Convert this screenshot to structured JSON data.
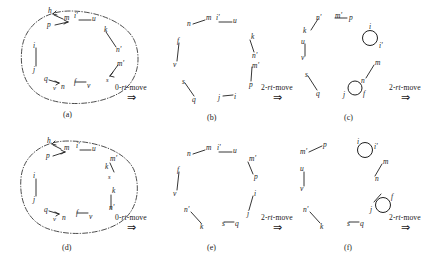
{
  "figure": {
    "width": 441,
    "height": 272,
    "ink_color": "#1a1a1a",
    "panels": [
      {
        "id": "a",
        "caption": "(a)",
        "has_dashdot_loop": true,
        "nodes": [
          "h",
          "m",
          "i'",
          "u",
          "p",
          "k",
          "n'",
          "i",
          "j",
          "q",
          "v",
          "n",
          "f",
          "v2",
          "m'",
          "s"
        ]
      },
      {
        "id": "b",
        "caption": "(b)",
        "has_dashdot_loop": false,
        "nodes": [
          "n",
          "m",
          "i'",
          "u",
          "k",
          "n'",
          "f",
          "v",
          "m'",
          "p",
          "s",
          "q",
          "j",
          "i"
        ]
      },
      {
        "id": "c",
        "caption": "(c)",
        "has_dashdot_loop": false,
        "nodes": [
          "n'",
          "m'",
          "p",
          "k",
          "i",
          "i'",
          "u",
          "v",
          "m",
          "n",
          "s",
          "q",
          "j",
          "f"
        ]
      },
      {
        "id": "d",
        "caption": "(d)",
        "has_dashdot_loop": true,
        "nodes": [
          "h",
          "m",
          "i'",
          "u",
          "p",
          "m'",
          "k",
          "s",
          "k2",
          "n'",
          "i",
          "j",
          "q",
          "v",
          "n",
          "f",
          "v2"
        ]
      },
      {
        "id": "e",
        "caption": "(e)",
        "has_dashdot_loop": false,
        "nodes": [
          "n",
          "m",
          "i'",
          "u",
          "m'",
          "p",
          "f",
          "v",
          "i",
          "j",
          "n'",
          "k",
          "s",
          "q"
        ]
      },
      {
        "id": "f",
        "caption": "(f)",
        "has_dashdot_loop": false,
        "nodes": [
          "m'",
          "p",
          "i",
          "i'",
          "m",
          "n",
          "u",
          "v",
          "j",
          "f",
          "n'",
          "k",
          "s",
          "q"
        ]
      }
    ],
    "operations": [
      {
        "id": "op-a-b",
        "label_prefix": "0-",
        "label_it": "rt",
        "label_suffix": "-move",
        "full": "0-rt-move",
        "arrow": "⇒"
      },
      {
        "id": "op-b-c",
        "label_prefix": "2-",
        "label_it": "rt",
        "label_suffix": "-move",
        "full": "2-rt-move",
        "arrow": "⇒"
      },
      {
        "id": "op-c-next",
        "label_prefix": "2-",
        "label_it": "rt",
        "label_suffix": "-move",
        "full": "2-rt-move",
        "arrow": "⇒"
      },
      {
        "id": "op-d-e",
        "label_prefix": "0-",
        "label_it": "rt",
        "label_suffix": "-move",
        "full": "0-rt-move",
        "arrow": "⇒"
      },
      {
        "id": "op-e-f",
        "label_prefix": "2-",
        "label_it": "rt",
        "label_suffix": "-move",
        "full": "2-rt-move",
        "arrow": "⇒"
      },
      {
        "id": "op-f-next",
        "label_prefix": "2-",
        "label_it": "rt",
        "label_suffix": "-move",
        "full": "2-rt-move",
        "arrow": "⇒"
      }
    ],
    "labels": {
      "h": "h",
      "m": "m",
      "i_prime": "i'",
      "u": "u",
      "p": "p",
      "k": "k",
      "n_prime": "n'",
      "i": "i",
      "j": "j",
      "q": "q",
      "v": "v",
      "n": "n",
      "f": "f",
      "m_prime": "m'",
      "s": "s",
      "j_prime": "f"
    }
  }
}
